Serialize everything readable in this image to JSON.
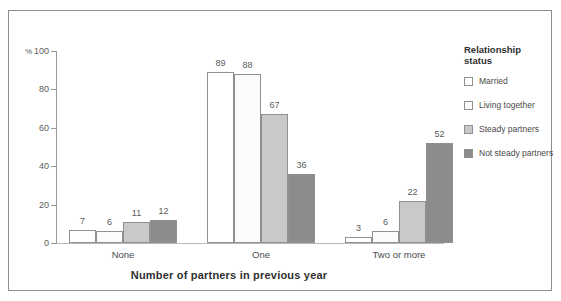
{
  "chart_data": {
    "type": "bar",
    "title": "",
    "xlabel": "Number of partners in previous year",
    "ylabel": "%",
    "categories": [
      "None",
      "One",
      "Two or more"
    ],
    "series": [
      {
        "name": "Married",
        "values": [
          7,
          89,
          3
        ],
        "color": "#ffffff"
      },
      {
        "name": "Living together",
        "values": [
          6,
          88,
          6
        ],
        "color": "#fbfbfb"
      },
      {
        "name": "Steady partners",
        "values": [
          11,
          67,
          22
        ],
        "color": "#c9c9c9"
      },
      {
        "name": "Not steady partners",
        "values": [
          12,
          36,
          52
        ],
        "color": "#8c8c8c"
      }
    ],
    "ylim": [
      0,
      100
    ],
    "yticks": [
      0,
      20,
      40,
      60,
      80,
      100
    ],
    "ytick_labels": [
      "0",
      "20",
      "40",
      "60",
      "80",
      "100"
    ],
    "grid": false,
    "legend_position": "right",
    "legend_title": "Relationship status",
    "value_labels": true
  },
  "legend": {
    "title_line1": "Relationship",
    "title_line2": "status"
  },
  "axis": {
    "percent_symbol": "%"
  }
}
